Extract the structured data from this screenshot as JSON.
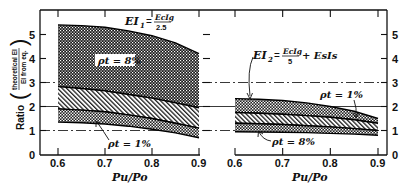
{
  "chart_data": [
    {
      "type": "area",
      "panel": "left",
      "title": "EI1 = Ec Ig / 2.5",
      "formula": {
        "lhs": "EI",
        "sub": "1",
        "num": "Ec Ig",
        "den": "2.5"
      },
      "xlabel": "Pu/Po",
      "ylabel": "Ratio (theoretical EI / EI from eq.)",
      "xlim": [
        0.6,
        0.9
      ],
      "ylim": [
        0,
        5.5
      ],
      "xticks": [
        "0.6",
        "0.7",
        "0.8",
        "0.9"
      ],
      "yticks": [
        "0",
        "1",
        "2",
        "3",
        "4",
        "5"
      ],
      "x": [
        0.6,
        0.65,
        0.7,
        0.75,
        0.8,
        0.85,
        0.9
      ],
      "bands": [
        {
          "name": "rho_t = 8% (upper band)",
          "pattern": "dots-dense",
          "upper": [
            5.4,
            5.37,
            5.3,
            5.15,
            4.95,
            4.65,
            4.2
          ],
          "lower": [
            2.83,
            2.75,
            2.65,
            2.5,
            2.35,
            2.15,
            1.95
          ]
        },
        {
          "name": "middle hatched",
          "pattern": "hatch",
          "upper": [
            2.83,
            2.75,
            2.65,
            2.5,
            2.35,
            2.15,
            1.95
          ],
          "lower": [
            1.9,
            1.85,
            1.78,
            1.65,
            1.5,
            1.3,
            1.1
          ]
        },
        {
          "name": "rho_t = 1% (lower band)",
          "pattern": "dots",
          "upper": [
            1.9,
            1.85,
            1.78,
            1.65,
            1.5,
            1.3,
            1.1
          ],
          "lower": [
            1.35,
            1.32,
            1.27,
            1.18,
            1.05,
            0.9,
            0.7
          ]
        }
      ],
      "annotations": [
        {
          "text": "ρt = 8%",
          "x": 0.67,
          "y": 4.0
        },
        {
          "text": "ρt = 1%",
          "x": 0.7,
          "y": 0.7
        }
      ],
      "reference_lines": [
        1,
        2,
        3
      ]
    },
    {
      "type": "area",
      "panel": "right",
      "title": "EI2 = Ec Ig / 5 + Es Is",
      "formula": {
        "lhs": "EI",
        "sub": "2",
        "num": "Ec Ig",
        "den": "5",
        "tail": "+ Es Is"
      },
      "xlabel": "Pu/Po",
      "ylabel": "",
      "xlim": [
        0.6,
        0.9
      ],
      "ylim": [
        0,
        5.5
      ],
      "xticks": [
        "0.6",
        "0.7",
        "0.8",
        "0.9"
      ],
      "yticks": [
        "0",
        "1",
        "2",
        "3",
        "4",
        "5"
      ],
      "x": [
        0.6,
        0.65,
        0.7,
        0.75,
        0.8,
        0.85,
        0.9
      ],
      "bands": [
        {
          "name": "rho_t = 1% (upper band)",
          "pattern": "dots",
          "upper": [
            2.33,
            2.3,
            2.25,
            2.15,
            2.0,
            1.8,
            1.5
          ],
          "lower": [
            1.75,
            1.72,
            1.68,
            1.62,
            1.55,
            1.45,
            1.3
          ]
        },
        {
          "name": "middle hatched",
          "pattern": "hatch",
          "upper": [
            1.75,
            1.72,
            1.68,
            1.62,
            1.55,
            1.45,
            1.3
          ],
          "lower": [
            1.3,
            1.28,
            1.25,
            1.2,
            1.15,
            1.08,
            1.0
          ]
        },
        {
          "name": "rho_t = 8% (lower band)",
          "pattern": "dots",
          "upper": [
            1.3,
            1.28,
            1.25,
            1.2,
            1.15,
            1.08,
            1.0
          ],
          "lower": [
            0.95,
            0.94,
            0.93,
            0.91,
            0.88,
            0.85,
            0.8
          ]
        }
      ],
      "annotations": [
        {
          "text": "ρt = 1%",
          "x": 0.84,
          "y": 2.35
        },
        {
          "text": "ρt = 8%",
          "x": 0.66,
          "y": 0.55
        }
      ],
      "reference_lines": [
        1,
        2,
        3
      ]
    }
  ],
  "labels": {
    "ylabel_ratio": "Ratio",
    "ylabel_num": "theoretical EI",
    "ylabel_den": "EI from eq.",
    "xlabel_left": "Pu/Po",
    "xlabel_right": "Pu/Po",
    "ann_left_top": "ρt = 8%",
    "ann_left_bottom": "ρt = 1%",
    "ann_right_top": "ρt = 1%",
    "ann_right_bottom": "ρt = 8%",
    "f1_lhs": "EI",
    "f1_sub": "1",
    "f1_num": "EcIg",
    "f1_den": "2.5",
    "f2_lhs": "EI",
    "f2_sub": "2",
    "f2_num": "EcIg",
    "f2_den": "5",
    "f2_tail": "+ EsIs"
  }
}
